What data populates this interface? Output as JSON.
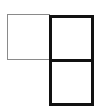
{
  "diagram": {
    "shapes": [
      {
        "id": "thin-square",
        "style": "thin",
        "color": "#8a8a8a"
      },
      {
        "id": "thick-rectangle",
        "style": "thick",
        "color": "#111111",
        "cells": 2
      }
    ],
    "colors": {
      "thin_stroke": "#8a8a8a",
      "thick_stroke": "#111111",
      "background": "#ffffff"
    }
  }
}
